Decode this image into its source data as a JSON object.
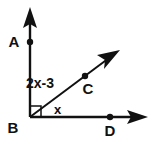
{
  "figure": {
    "background_color": "#ffffff",
    "stroke_color": "#111111",
    "vertex": "B",
    "points": {
      "A": {
        "label": "A",
        "x": 30,
        "y": 42,
        "label_x": 14,
        "label_y": 47
      },
      "B": {
        "label": "B",
        "x": 30,
        "y": 117,
        "label_x": 13,
        "label_y": 133
      },
      "C": {
        "label": "C",
        "x": 85,
        "y": 76,
        "label_x": 84,
        "label_y": 94
      },
      "D": {
        "label": "D",
        "x": 110,
        "y": 117,
        "label_x": 104,
        "label_y": 136
      }
    },
    "rays": [
      {
        "name": "ray-BA",
        "from": "B",
        "to": "A",
        "arrow": true,
        "tip_x": 30,
        "tip_y": 8
      },
      {
        "name": "ray-BC",
        "from": "B",
        "to": "C",
        "arrow": true,
        "tip_x": 119,
        "tip_y": 51
      },
      {
        "name": "ray-BD",
        "from": "B",
        "to": "D",
        "arrow": true,
        "tip_x": 147,
        "tip_y": 117
      }
    ],
    "angle_labels": [
      {
        "name": "angle-ABC",
        "text": "2x-3",
        "x": 26,
        "y": 88
      },
      {
        "name": "angle-CBD",
        "text": "x",
        "x": 54,
        "y": 114
      }
    ],
    "markers": [
      {
        "name": "right-angle-marker-ABD",
        "type": "square"
      }
    ]
  }
}
